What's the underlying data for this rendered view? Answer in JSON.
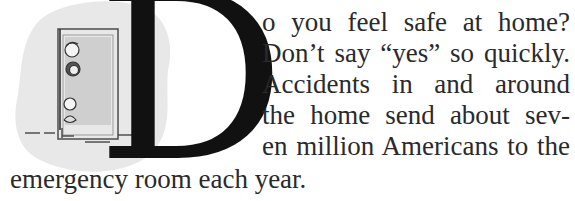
{
  "article": {
    "drop_cap": "D",
    "lines": [
      "o you feel safe at home?",
      "Don’t say “yes” so quickly.",
      "Accidents in and around",
      "the home send about sev-",
      "en million Americans to the",
      "emergency room each year."
    ],
    "full_text": "Do you feel safe at home? Don’t say “yes” so quickly. Accidents in and around the home send about seven million Americans to the emergency room each year."
  },
  "illustration": {
    "description": "Cartoon of children peeking around an open doorway, on a light gray blob background",
    "background_color": "#e6e6e6",
    "door_fill": "#cfcfcf"
  }
}
